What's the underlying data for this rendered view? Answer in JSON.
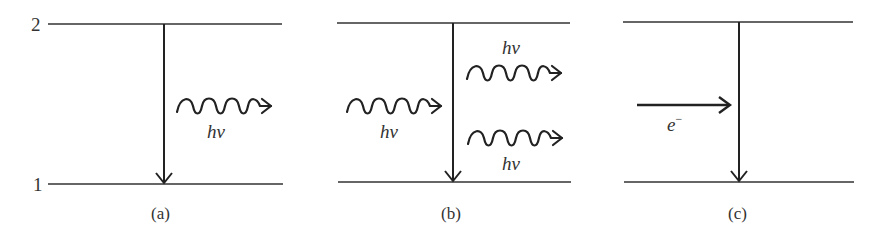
{
  "figure": {
    "level_labels": {
      "upper": "2",
      "lower": "1"
    },
    "panels": [
      {
        "id": "a",
        "caption": "(a)",
        "process": "spontaneous emission",
        "photons": [
          {
            "label": "hν",
            "direction": "outgoing"
          }
        ]
      },
      {
        "id": "b",
        "caption": "(b)",
        "process": "stimulated emission",
        "photons": [
          {
            "label": "hν",
            "direction": "incoming"
          },
          {
            "label": "hν",
            "direction": "outgoing"
          },
          {
            "label": "hν",
            "direction": "outgoing"
          }
        ]
      },
      {
        "id": "c",
        "caption": "(c)",
        "process": "electron collision",
        "particle": {
          "label": "e",
          "superscript": "−"
        }
      }
    ],
    "colors": {
      "ink": "#333333",
      "background": "#ffffff"
    }
  }
}
